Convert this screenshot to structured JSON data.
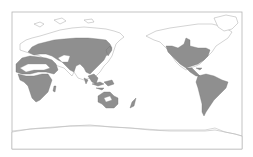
{
  "map": {
    "projection": "pacific-centered world map",
    "colors": {
      "background": "#ffffff",
      "frame": "#b5b5b5",
      "land_outline": "#a9a9a9",
      "distribution_fill": "#8f8f8f"
    },
    "regions": [
      {
        "name": "Europe and northern Asia",
        "shaded": true
      },
      {
        "name": "North Africa and Mediterranean",
        "shaded": true
      },
      {
        "name": "Sub-Saharan Africa",
        "shaded": true
      },
      {
        "name": "South and Southeast Asia",
        "shaded": true
      },
      {
        "name": "Maritime Southeast Asia",
        "shaded": true
      },
      {
        "name": "Australia",
        "shaded": true
      },
      {
        "name": "New Zealand",
        "shaded": true
      },
      {
        "name": "North America",
        "shaded": true
      },
      {
        "name": "Central America and Caribbean",
        "shaded": true
      },
      {
        "name": "South America",
        "shaded": true
      }
    ]
  }
}
